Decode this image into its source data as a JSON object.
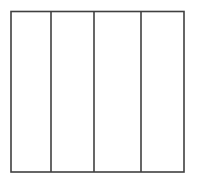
{
  "figure": {
    "title": "",
    "caption": "",
    "kind": "line-diagram",
    "canvas": {
      "width": 197,
      "height": 184
    },
    "background_color": "#ffffff",
    "stroke_color": "#404040",
    "stroke_width": 1.6,
    "outline": {
      "name": "outer-rectangle",
      "x": 11,
      "y": 11.5,
      "width": 173,
      "height": 160.5,
      "right": 184,
      "bottom": 172
    },
    "dividers": [
      {
        "name": "divider-1",
        "x": 51,
        "y_top": 11.5,
        "y_bottom": 172
      },
      {
        "name": "divider-2",
        "x": 94,
        "y_top": 11.5,
        "y_bottom": 172
      },
      {
        "name": "divider-3",
        "x": 141,
        "y_top": 11.5,
        "y_bottom": 172
      }
    ],
    "panels": [
      {
        "name": "panel-1",
        "label": "",
        "x": 11,
        "width": 40
      },
      {
        "name": "panel-2",
        "label": "",
        "x": 51,
        "width": 43
      },
      {
        "name": "panel-3",
        "label": "",
        "x": 94,
        "width": 47
      },
      {
        "name": "panel-4",
        "label": "",
        "x": 141,
        "width": 43
      }
    ]
  }
}
